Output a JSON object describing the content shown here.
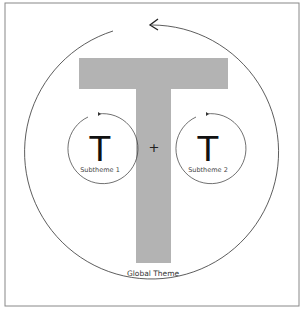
{
  "diagram": {
    "global": {
      "letter": "T",
      "label": "Global Theme",
      "fill": "#b3b3b3"
    },
    "operator": "+",
    "subthemes": [
      {
        "letter": "T",
        "label": "Subtheme 1"
      },
      {
        "letter": "T",
        "label": "Subtheme 2"
      }
    ]
  }
}
